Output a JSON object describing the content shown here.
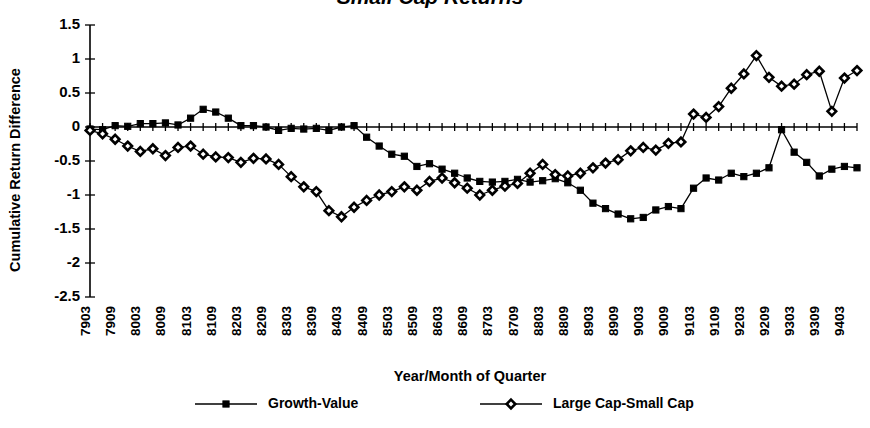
{
  "chart_data": {
    "type": "line",
    "title": "Small Cap Returns",
    "xlabel": "Year/Month of Quarter",
    "ylabel": "Cumulative Return Difference",
    "ylim": [
      -2.5,
      1.5
    ],
    "ytick_labels": [
      "1.5",
      "1",
      "0.5",
      "0",
      "-0.5",
      "-1",
      "-1.5",
      "-2",
      "-2.5"
    ],
    "ytick_values": [
      1.5,
      1,
      0.5,
      0,
      -0.5,
      -1,
      -1.5,
      -2,
      -2.5
    ],
    "grid": false,
    "legend_position": "bottom",
    "x_tick_count": 62,
    "xtick_labels": [
      "7903",
      "7909",
      "8003",
      "8009",
      "8103",
      "8109",
      "8203",
      "8209",
      "8303",
      "8309",
      "8403",
      "8409",
      "8503",
      "8509",
      "8603",
      "8609",
      "8703",
      "8709",
      "8803",
      "8809",
      "8903",
      "8909",
      "9003",
      "9009",
      "9103",
      "9109",
      "9203",
      "9209",
      "9303",
      "9309",
      "9403"
    ],
    "x": [
      "7903",
      "7906",
      "7909",
      "7912",
      "8003",
      "8006",
      "8009",
      "8012",
      "8103",
      "8106",
      "8109",
      "8112",
      "8203",
      "8206",
      "8209",
      "8212",
      "8303",
      "8306",
      "8309",
      "8312",
      "8403",
      "8406",
      "8409",
      "8412",
      "8503",
      "8506",
      "8509",
      "8512",
      "8603",
      "8606",
      "8609",
      "8612",
      "8703",
      "8706",
      "8709",
      "8712",
      "8803",
      "8806",
      "8809",
      "8812",
      "8903",
      "8906",
      "8909",
      "8912",
      "9003",
      "9006",
      "9009",
      "9012",
      "9103",
      "9106",
      "9109",
      "9112",
      "9203",
      "9206",
      "9209",
      "9212",
      "9303",
      "9306",
      "9309",
      "9312",
      "9403",
      "9406"
    ],
    "series": [
      {
        "name": "Growth-Value",
        "marker": "square",
        "values": [
          -0.03,
          -0.04,
          0.02,
          0.01,
          0.05,
          0.05,
          0.06,
          0.03,
          0.13,
          0.26,
          0.22,
          0.13,
          0.02,
          0.02,
          0.0,
          -0.05,
          -0.02,
          -0.03,
          -0.02,
          -0.05,
          0.0,
          0.02,
          -0.15,
          -0.28,
          -0.4,
          -0.43,
          -0.58,
          -0.54,
          -0.62,
          -0.68,
          -0.75,
          -0.8,
          -0.81,
          -0.8,
          -0.77,
          -0.81,
          -0.79,
          -0.76,
          -0.82,
          -0.93,
          -1.12,
          -1.2,
          -1.28,
          -1.35,
          -1.33,
          -1.22,
          -1.17,
          -1.2,
          -0.9,
          -0.75,
          -0.78,
          -0.68,
          -0.73,
          -0.68,
          -0.6,
          -0.04,
          -0.37,
          -0.52,
          -0.72,
          -0.62,
          -0.58,
          -0.6
        ]
      },
      {
        "name": "Large Cap-Small Cap",
        "marker": "diamond",
        "values": [
          -0.05,
          -0.1,
          -0.18,
          -0.28,
          -0.36,
          -0.32,
          -0.42,
          -0.3,
          -0.28,
          -0.4,
          -0.44,
          -0.45,
          -0.52,
          -0.46,
          -0.47,
          -0.55,
          -0.73,
          -0.88,
          -0.95,
          -1.23,
          -1.32,
          -1.18,
          -1.08,
          -1.0,
          -0.95,
          -0.88,
          -0.93,
          -0.8,
          -0.75,
          -0.82,
          -0.9,
          -1.0,
          -0.93,
          -0.87,
          -0.83,
          -0.68,
          -0.55,
          -0.7,
          -0.72,
          -0.68,
          -0.6,
          -0.53,
          -0.48,
          -0.35,
          -0.3,
          -0.34,
          -0.24,
          -0.22,
          0.19,
          0.14,
          0.3,
          0.57,
          0.78,
          1.05,
          0.73,
          0.6,
          0.63,
          0.77,
          0.82,
          0.23,
          0.72,
          0.83
        ]
      }
    ]
  },
  "legend": {
    "items": [
      {
        "label": "Growth-Value",
        "marker": "square"
      },
      {
        "label": "Large Cap-Small Cap",
        "marker": "diamond"
      }
    ]
  }
}
